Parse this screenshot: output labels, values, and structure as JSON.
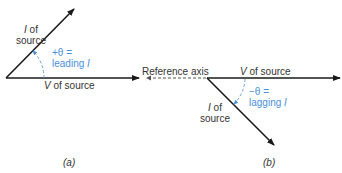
{
  "colors": {
    "line": "#1a1a1a",
    "accent": "#4a90d9",
    "text": "#333333",
    "dashed": "#555555"
  },
  "diagram_a": {
    "current_label_sym": "I",
    "current_label_rest": " of",
    "current_label_line2": "source",
    "angle_line1": "+θ =",
    "angle_line2_text": "leading ",
    "angle_line2_sym": "I",
    "voltage_sym": "V",
    "voltage_rest": " of source",
    "caption": "(a)"
  },
  "diagram_b": {
    "reference_axis": "Reference  axis",
    "voltage_sym": "V",
    "voltage_rest": " of source",
    "current_label_sym": "I",
    "current_label_rest": " of",
    "current_label_line2": "source",
    "angle_line1": "−θ =",
    "angle_line2_text": "lagging  ",
    "angle_line2_sym": "I",
    "caption": "(b)"
  }
}
